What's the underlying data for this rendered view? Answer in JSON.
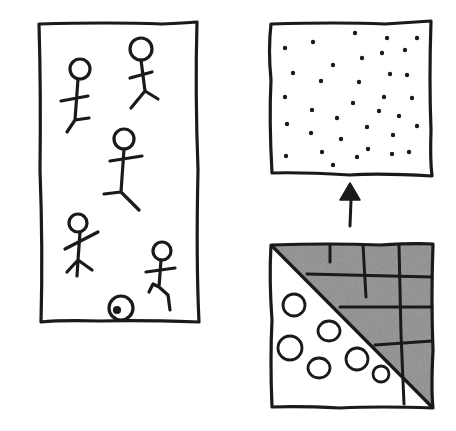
{
  "diagram": {
    "colors": {
      "ink": "#1a1a1a",
      "shade": "#8c8c8c",
      "paper": "#ffffff"
    },
    "panels": [
      {
        "id": "people-panel",
        "content": "5 stick figures and a small spiral/ball"
      },
      {
        "id": "dots-panel",
        "content": "scattered dots",
        "dot_count": 35
      },
      {
        "id": "split-panel",
        "content": "upper-right triangle shaded with grid; lower-left triangle with 7 circles"
      }
    ],
    "arrow": {
      "from": "split-panel",
      "to": "dots-panel",
      "direction": "up"
    }
  }
}
